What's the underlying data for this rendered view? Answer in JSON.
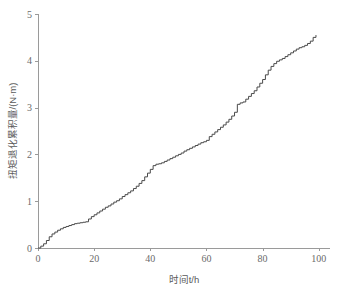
{
  "chart_data": {
    "type": "line",
    "title": "",
    "xlabel": "时间t/h",
    "ylabel": "扭矩退化累积量/(N·m)",
    "xlim": [
      0,
      104
    ],
    "ylim": [
      0,
      5
    ],
    "xticks": [
      0,
      20,
      40,
      60,
      80,
      100
    ],
    "yticks": [
      0,
      1,
      2,
      3,
      4,
      5
    ],
    "xtick_labels": [
      "0",
      "20",
      "40",
      "60",
      "80",
      "100"
    ],
    "ytick_labels": [
      "0",
      "1",
      "2",
      "3",
      "4",
      "5"
    ],
    "grid": false,
    "legend": null,
    "line_color": "#4a4a4a",
    "axis_color": "#9a9a9a",
    "step_style": "post",
    "series": [
      {
        "name": "扭矩退化累积量",
        "x": [
          0,
          1,
          2,
          3,
          4,
          5,
          6,
          7,
          8,
          9,
          10,
          11,
          12,
          13,
          14,
          15,
          16,
          17,
          18,
          19,
          20,
          21,
          22,
          23,
          24,
          25,
          26,
          27,
          28,
          29,
          30,
          31,
          32,
          33,
          34,
          35,
          36,
          37,
          38,
          39,
          40,
          41,
          42,
          43,
          44,
          45,
          46,
          47,
          48,
          49,
          50,
          51,
          52,
          53,
          54,
          55,
          56,
          57,
          58,
          59,
          60,
          61,
          62,
          63,
          64,
          65,
          66,
          67,
          68,
          69,
          70,
          71,
          72,
          73,
          74,
          75,
          76,
          77,
          78,
          79,
          80,
          81,
          82,
          83,
          84,
          85,
          86,
          87,
          88,
          89,
          90,
          91,
          92,
          93,
          94,
          95,
          96,
          97,
          98,
          99
        ],
        "y": [
          0.0,
          0.04,
          0.09,
          0.16,
          0.24,
          0.3,
          0.34,
          0.38,
          0.41,
          0.44,
          0.46,
          0.48,
          0.5,
          0.52,
          0.53,
          0.54,
          0.55,
          0.56,
          0.62,
          0.67,
          0.71,
          0.75,
          0.79,
          0.83,
          0.87,
          0.9,
          0.94,
          0.98,
          1.01,
          1.05,
          1.1,
          1.14,
          1.18,
          1.22,
          1.27,
          1.32,
          1.38,
          1.44,
          1.52,
          1.6,
          1.68,
          1.76,
          1.79,
          1.8,
          1.82,
          1.85,
          1.88,
          1.91,
          1.94,
          1.97,
          2.0,
          2.03,
          2.07,
          2.1,
          2.13,
          2.16,
          2.19,
          2.22,
          2.25,
          2.27,
          2.3,
          2.38,
          2.43,
          2.48,
          2.53,
          2.58,
          2.63,
          2.69,
          2.75,
          2.82,
          2.9,
          3.07,
          3.1,
          3.12,
          3.18,
          3.24,
          3.3,
          3.36,
          3.44,
          3.52,
          3.6,
          3.7,
          3.8,
          3.88,
          3.94,
          3.99,
          4.02,
          4.05,
          4.09,
          4.13,
          4.17,
          4.21,
          4.25,
          4.28,
          4.3,
          4.33,
          4.37,
          4.42,
          4.5,
          4.55
        ]
      }
    ]
  },
  "figure": {
    "background_color": "#ffffff",
    "plot_area": {
      "left_px": 38,
      "right_px": 330,
      "top_px": 14,
      "bottom_px": 248
    }
  }
}
